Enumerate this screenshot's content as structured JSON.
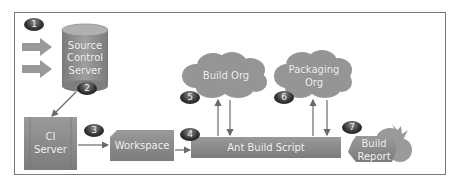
{
  "diagram": {
    "nodes": {
      "source_control": {
        "label_lines": [
          "Source",
          "Control",
          "Server"
        ]
      },
      "ci_server": {
        "label_lines": [
          "CI",
          "Server"
        ]
      },
      "workspace": {
        "label": "Workspace"
      },
      "ant_build_script": {
        "label": "Ant Build Script"
      },
      "build_org": {
        "label": "Build Org"
      },
      "packaging_org": {
        "label_lines": [
          "Packaging",
          "Org"
        ]
      },
      "build_report": {
        "label_lines": [
          "Build",
          "Report"
        ]
      }
    },
    "badges": [
      "1",
      "2",
      "3",
      "4",
      "5",
      "6",
      "7"
    ],
    "colors": {
      "shape_fill": "#8c8c8c",
      "shape_dark": "#6f6f6f",
      "badge": "#2a2a2a",
      "border": "#7a7a7a",
      "arrow": "#6a6a6a"
    }
  }
}
